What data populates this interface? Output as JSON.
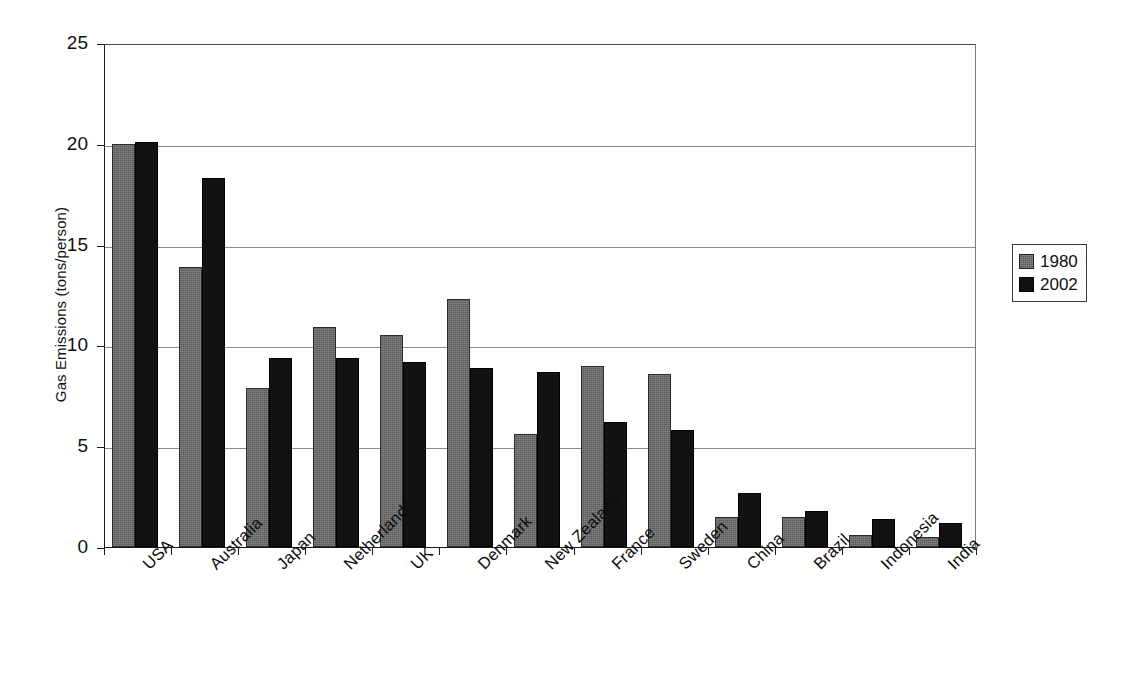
{
  "chart_data": {
    "type": "bar",
    "title": "",
    "xlabel": "",
    "ylabel": "Gas Emissions (tons/person)",
    "ylim": [
      0,
      25
    ],
    "yticks": [
      0,
      5,
      10,
      15,
      20,
      25
    ],
    "ytick_labels": [
      "0",
      "5",
      "10",
      "15",
      "20",
      "25"
    ],
    "grid": true,
    "grid_axis": "y",
    "legend_position": "right",
    "categories": [
      "USA",
      "Australia",
      "Japan",
      "Netherlands",
      "UK",
      "Denmark",
      "New Zealand",
      "France",
      "Sweden",
      "China",
      "Brazil",
      "Indonesia",
      "India"
    ],
    "series": [
      {
        "name": "1980",
        "color": "#5b5b5b",
        "values": [
          20.0,
          13.9,
          7.9,
          10.9,
          10.5,
          12.3,
          5.6,
          9.0,
          8.6,
          1.5,
          1.5,
          0.6,
          0.5
        ]
      },
      {
        "name": "2002",
        "color": "#121212",
        "values": [
          20.1,
          18.3,
          9.4,
          9.4,
          9.2,
          8.9,
          8.7,
          6.2,
          5.8,
          2.7,
          1.8,
          1.4,
          1.2
        ]
      }
    ]
  },
  "legend": {
    "entries": [
      {
        "label": "1980"
      },
      {
        "label": "2002"
      }
    ]
  }
}
